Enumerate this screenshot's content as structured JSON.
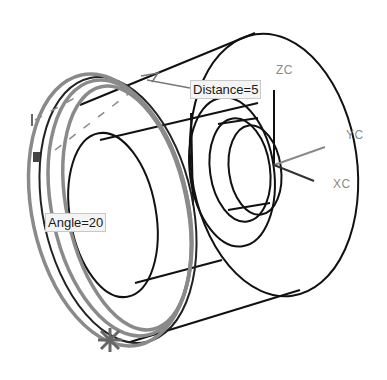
{
  "viewport": {
    "background": "#ffffff",
    "model_line_color": "#111111",
    "preview_line_color": "#8a8a8a"
  },
  "dimensions": {
    "distance": {
      "label": "Distance=5"
    },
    "angle": {
      "label": "Angle=20"
    }
  },
  "axes": {
    "zc": "ZC",
    "yc": "YC",
    "xc": "XC"
  }
}
